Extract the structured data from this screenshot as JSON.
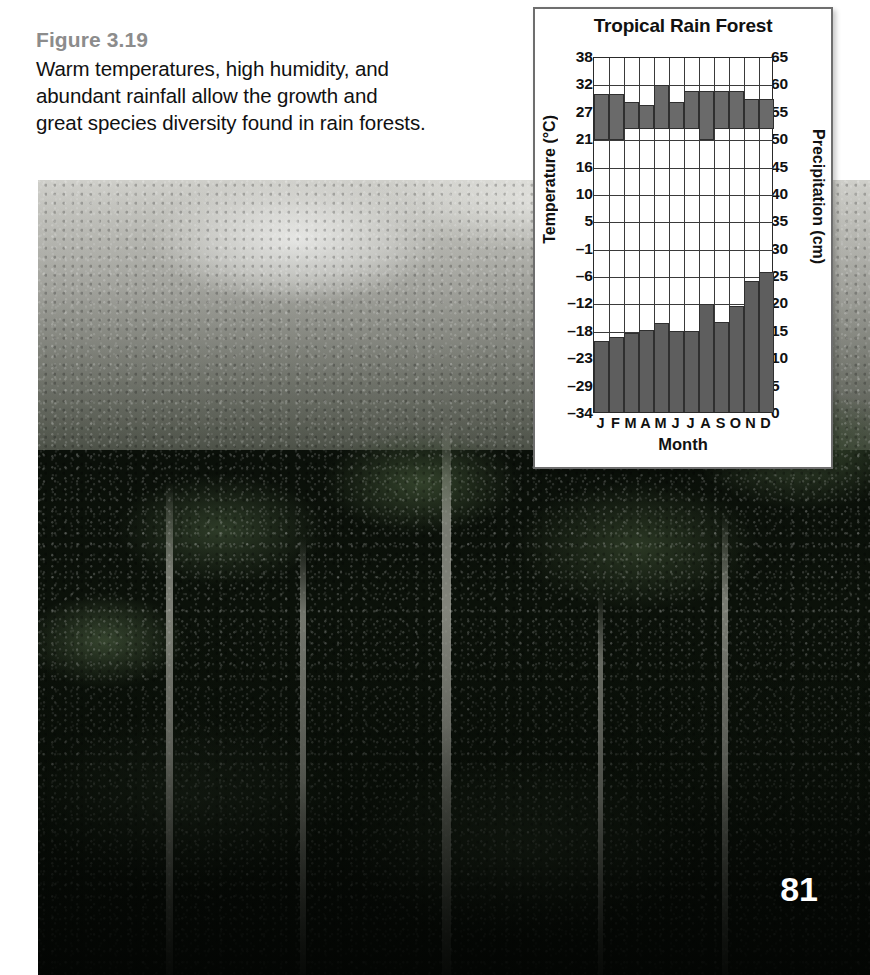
{
  "caption": {
    "figure_label": "Figure 3.19",
    "line1": "Warm temperatures, high humidity, and",
    "line2": "abundant rainfall allow the growth and",
    "line3": "great species diversity found in rain forests."
  },
  "page_number": "81",
  "colors": {
    "bar_fill": "#5e5e5e",
    "band_fill": "#6a6a6a",
    "grid": "#3a3a3a",
    "panel_border": "#6e6e6e",
    "figure_label": "#8c8c8c"
  },
  "chart_data": {
    "type": "bar",
    "title": "Tropical Rain Forest",
    "xlabel": "Month",
    "ylabel": "Temperature (°C)",
    "y2label": "Precipitation (cm)",
    "grid": true,
    "legend": "none",
    "categories": [
      "J",
      "F",
      "M",
      "A",
      "M",
      "J",
      "J",
      "A",
      "S",
      "O",
      "N",
      "D"
    ],
    "ylim": [
      -34,
      38
    ],
    "y2lim": [
      0,
      65
    ],
    "yticks": [
      38,
      32,
      27,
      21,
      16,
      10,
      5,
      -1,
      -6,
      -12,
      -18,
      -23,
      -29,
      -34
    ],
    "yticks_labels": [
      "38",
      "32",
      "27",
      "21",
      "16",
      "10",
      "5",
      "–1",
      "–6",
      "–12",
      "–18",
      "–23",
      "–29",
      "–34"
    ],
    "y2ticks": [
      65,
      60,
      55,
      50,
      45,
      40,
      35,
      30,
      25,
      20,
      15,
      10,
      5,
      0
    ],
    "y2ticks_labels": [
      "65",
      "60",
      "55",
      "50",
      "45",
      "40",
      "35",
      "30",
      "25",
      "20",
      "15",
      "10",
      "5",
      "0"
    ],
    "series": [
      {
        "name": "Precipitation",
        "axis": "right",
        "unit": "cm",
        "values": [
          13.0,
          13.7,
          14.5,
          15.0,
          16.2,
          14.8,
          14.8,
          19.8,
          16.4,
          19.3,
          24.0,
          25.5
        ]
      },
      {
        "name": "Temperature range",
        "axis": "left",
        "unit": "°C",
        "type": "range",
        "low": [
          21.0,
          21.0,
          23.5,
          23.5,
          23.5,
          23.5,
          23.5,
          21.0,
          23.5,
          23.5,
          23.5,
          23.5
        ],
        "high": [
          30.5,
          30.5,
          29.0,
          28.5,
          32.0,
          29.0,
          31.0,
          31.0,
          31.0,
          31.0,
          29.5,
          29.5
        ]
      }
    ]
  }
}
